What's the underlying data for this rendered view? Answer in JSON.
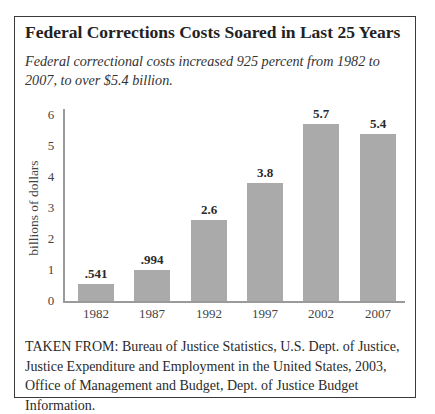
{
  "figure": {
    "title": "Federal Corrections Costs Soared in Last 25 Years",
    "subtitle": "Federal correctional costs increased 925 percent from 1982 to 2007, to over $5.4 billion.",
    "source": "TAKEN FROM: Bureau of Justice Statistics, U.S. Dept. of Justice, Justice Expenditure and Employment in the United States, 2003, Office of Management and Budget, Dept. of Justice Budget Information."
  },
  "chart_data": {
    "type": "bar",
    "title": "Federal Corrections Costs Soared in Last 25 Years",
    "subtitle": "Federal correctional costs increased 925 percent from 1982 to 2007, to over $5.4 billion.",
    "xlabel": "",
    "ylabel": "billions of dollars",
    "categories": [
      "1982",
      "1987",
      "1992",
      "1997",
      "2002",
      "2007"
    ],
    "values": [
      0.541,
      0.994,
      2.6,
      3.8,
      5.7,
      5.4
    ],
    "data_labels": [
      ".541",
      ".994",
      "2.6",
      "3.8",
      "5.7",
      "5.4"
    ],
    "ylim": [
      0,
      6
    ],
    "yticks": [
      "0",
      "1",
      "2",
      "3",
      "4",
      "5",
      "6"
    ],
    "grid": false,
    "legend": null,
    "bar_color": "#aaaaaa",
    "axis_color": "#9a9a9a"
  }
}
